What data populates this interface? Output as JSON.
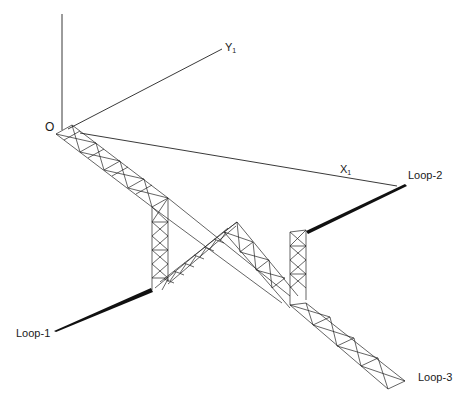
{
  "diagram": {
    "type": "3D truss structure with coordinate axes",
    "axes": {
      "origin_label": "O",
      "x_axis_label": "X",
      "x_axis_subscript": "1",
      "y_axis_label": "Y",
      "y_axis_subscript": "1"
    },
    "loops": [
      {
        "id": "loop-1",
        "label": "Loop-1"
      },
      {
        "id": "loop-2",
        "label": "Loop-2"
      },
      {
        "id": "loop-3",
        "label": "Loop-3"
      }
    ],
    "colors": {
      "line": "#222222",
      "background": "#ffffff"
    }
  }
}
